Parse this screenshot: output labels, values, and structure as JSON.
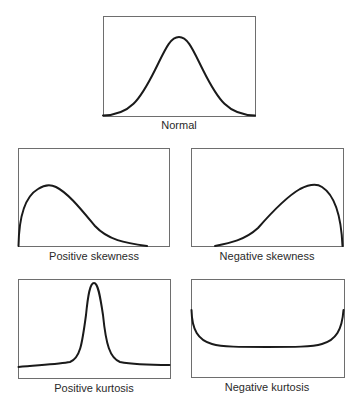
{
  "figure": {
    "panels": [
      {
        "id": "normal",
        "label": "Normal",
        "frame": {
          "x": 103,
          "y": 16,
          "w": 152,
          "h": 100
        },
        "label_pos": {
          "x": 179,
          "y": 129
        },
        "curve_path": "M103,115.5 C130,115 140,100 155,70 C165,50 170,37 179,37 C188,37 193,50 203,70 C218,100 228,115 255,115.5"
      },
      {
        "id": "positive-skewness",
        "label": "Positive skewness",
        "frame": {
          "x": 18,
          "y": 148,
          "w": 151,
          "h": 98
        },
        "label_pos": {
          "x": 94,
          "y": 260
        },
        "curve_path": "M18.5,246 C19,215 26,196 38,189 C44,185 50,184 56,187 C68,193 80,208 95,226 C108,240 125,243 147,246"
      },
      {
        "id": "negative-skewness",
        "label": "Negative skewness",
        "frame": {
          "x": 191,
          "y": 148,
          "w": 152,
          "h": 98
        },
        "label_pos": {
          "x": 267,
          "y": 260
        },
        "curve_path": "M215,246 C230,243 245,240 258,228 C272,212 286,197 300,189 C308,185 316,183 322,187 C333,194 341,212 342.5,246"
      },
      {
        "id": "positive-kurtosis",
        "label": "Positive kurtosis",
        "frame": {
          "x": 18,
          "y": 279,
          "w": 152,
          "h": 99
        },
        "label_pos": {
          "x": 94,
          "y": 392
        },
        "curve_path": "M18.5,367 C40,365 60,364 70,362 C80,358 82,345 86,315 C88,295 90,283 94,283 C98,283 100,295 103,315 C106,345 110,358 120,362 C130,364 150,365 169.5,365"
      },
      {
        "id": "negative-kurtosis",
        "label": "Negative kurtosis",
        "frame": {
          "x": 191,
          "y": 279,
          "w": 153,
          "h": 98
        },
        "label_pos": {
          "x": 267,
          "y": 391
        },
        "curve_path": "M191.5,310 C192,330 198,340 212,344 C222,347 240,347 267,347 C294,347 312,347 322,344 C336,340 342,330 343.5,310"
      }
    ],
    "cutoff_caption": "(caption text cut off at bottom edge)"
  }
}
